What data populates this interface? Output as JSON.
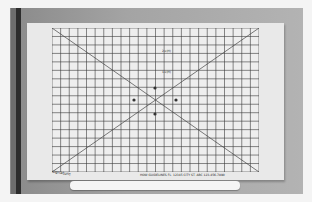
{
  "scene": {
    "description": "Photo of a calibration grid chart (graph paper) mounted on a white board with an X crosshair",
    "colors": {
      "background": "#a4a4a4",
      "board": "#e9e9e9",
      "sheet": "#eeeeee",
      "grid": "#333333",
      "pole": "#2d2d2d"
    }
  },
  "grid": {
    "columns": 24,
    "rows": 17,
    "diagonals": true,
    "x_axis_labels": [
      "13",
      "12",
      "11",
      "10",
      "9",
      "8",
      "7",
      "6",
      "5",
      "4",
      "3",
      "2",
      "1",
      "0",
      "1",
      "2",
      "3",
      "4",
      "5",
      "6",
      "7",
      "8",
      "9",
      "10",
      "11",
      "12",
      "13"
    ],
    "y_axis_labels": [
      "13",
      "12",
      "11",
      "10",
      "9",
      "8",
      "7",
      "6",
      "5",
      "4",
      "3",
      "2",
      "1",
      "0",
      "1",
      "2",
      "3",
      "4",
      "5",
      "6",
      "7",
      "8",
      "9",
      "10",
      "11",
      "12",
      "13"
    ],
    "annotations": [
      "2×(H)",
      "1×(H)"
    ]
  },
  "footer": {
    "text": "HOW GUIDELINES FL. 12345 CITY ST. ABC 123-456-7890",
    "signature": "signature"
  }
}
